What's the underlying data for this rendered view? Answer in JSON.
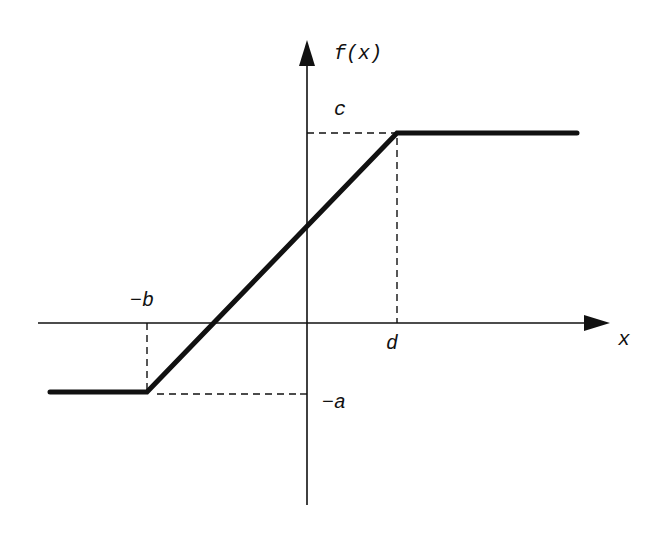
{
  "diagram": {
    "type": "piecewise-linear saturation function",
    "y_axis_label": "f(x)",
    "x_axis_label": "x",
    "labels": {
      "c": "c",
      "d": "d",
      "neg_b": "−b",
      "neg_a": "−a"
    },
    "colors": {
      "line": "#111111",
      "background": "#ffffff"
    }
  }
}
